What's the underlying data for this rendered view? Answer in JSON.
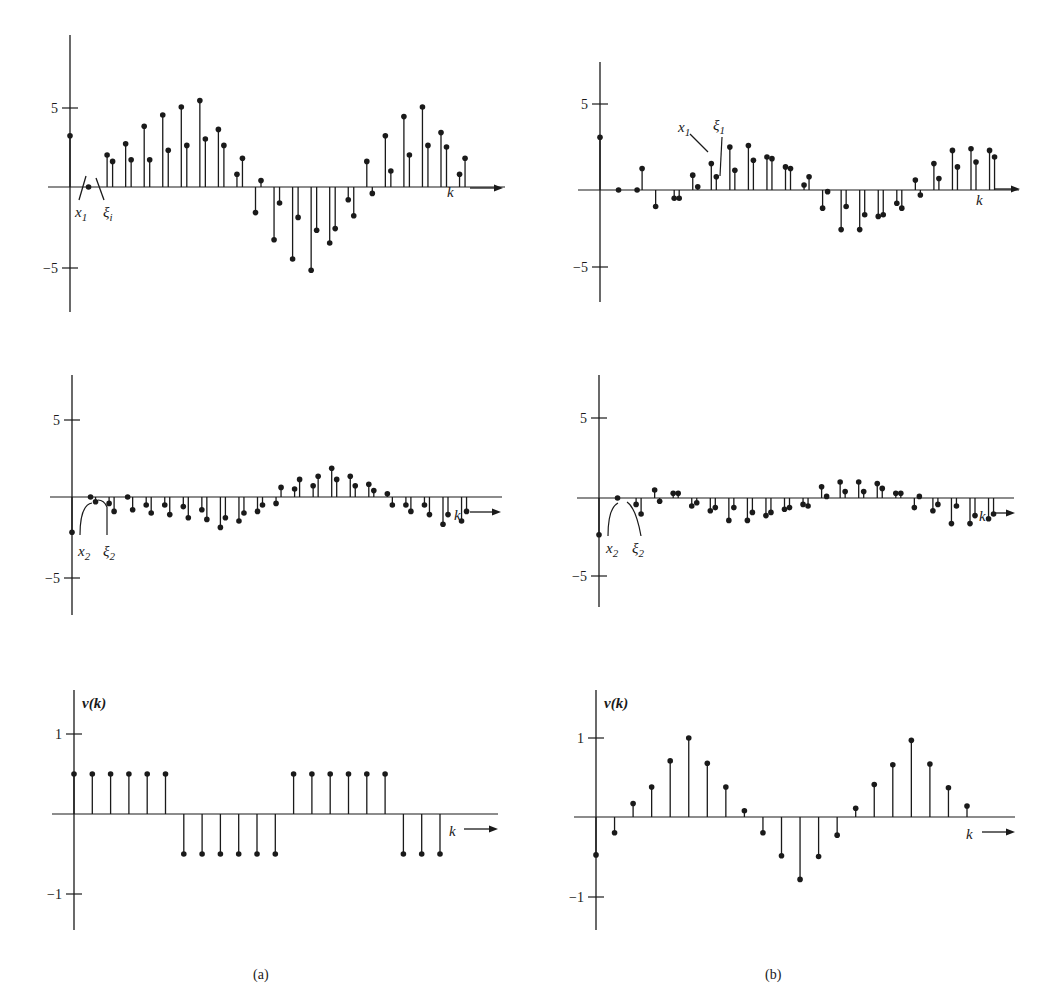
{
  "figure": {
    "captions": [
      "(a)",
      "(b)"
    ],
    "x_axis_label": "k",
    "ink_color": "#1a1a1a",
    "background": "#ffffff"
  },
  "chart_data": [
    {
      "id": "a-top",
      "panel": "(a)",
      "type": "stem",
      "title": "",
      "xlabel": "k",
      "ylabel": "",
      "yticks": [
        5,
        -5
      ],
      "ytick_labels": [
        "5",
        "−5"
      ],
      "ylim": [
        -7.5,
        9.5
      ],
      "grid": false,
      "annotations": [
        {
          "text": "x",
          "sub": "1"
        },
        {
          "text": "ξ",
          "sub": "i"
        }
      ],
      "series": [
        {
          "name": "x1",
          "values": [
            3.2,
            0.0,
            2.0,
            2.7,
            3.8,
            4.5,
            5.0,
            5.4,
            3.6,
            0.8,
            -1.6,
            -3.3,
            -4.5,
            -5.2,
            -3.5,
            -0.8,
            1.6,
            3.2,
            4.4,
            5.0,
            3.4,
            0.8
          ]
        },
        {
          "name": "ξ1",
          "values": [
            null,
            null,
            1.6,
            1.7,
            1.7,
            2.3,
            2.6,
            3.0,
            2.6,
            1.8,
            0.4,
            -1.0,
            -1.9,
            -2.7,
            -2.6,
            -1.8,
            -0.4,
            1.0,
            2.0,
            2.6,
            2.5,
            1.8
          ]
        }
      ]
    },
    {
      "id": "b-top",
      "panel": "(b)",
      "type": "stem",
      "title": "",
      "xlabel": "k",
      "ylabel": "",
      "yticks": [
        5,
        -5
      ],
      "ytick_labels": [
        "5",
        "−5"
      ],
      "ylim": [
        -7.5,
        7.5
      ],
      "grid": false,
      "annotations": [
        {
          "text": "x",
          "sub": "1"
        },
        {
          "text": "ξ",
          "sub": "1"
        }
      ],
      "series": [
        {
          "name": "x1",
          "values": [
            3.2,
            0.0,
            0.0,
            -1.0,
            -0.5,
            0.9,
            1.6,
            2.6,
            2.7,
            2.0,
            1.4,
            0.3,
            -1.1,
            -2.4,
            -2.4,
            -1.6,
            -0.8,
            0.6,
            1.6,
            2.4,
            2.5,
            2.4
          ]
        },
        {
          "name": "ξ1",
          "values": [
            null,
            null,
            1.3,
            null,
            -0.5,
            0.2,
            0.8,
            1.2,
            1.8,
            1.9,
            1.3,
            0.8,
            -0.1,
            -1.0,
            -1.5,
            -1.5,
            -1.1,
            -0.3,
            0.7,
            1.4,
            1.7,
            2.0
          ]
        }
      ]
    },
    {
      "id": "a-middle",
      "panel": "(a)",
      "type": "stem",
      "title": "",
      "xlabel": "k",
      "ylabel": "",
      "yticks": [
        5,
        -5
      ],
      "ytick_labels": [
        "5",
        "−5"
      ],
      "ylim": [
        -7.5,
        7.5
      ],
      "grid": false,
      "annotations": [
        {
          "text": "x",
          "sub": "2"
        },
        {
          "text": "ξ",
          "sub": "2"
        }
      ],
      "series": [
        {
          "name": "x2",
          "values": [
            -2.2,
            0.0,
            -0.4,
            0.0,
            -0.5,
            -0.5,
            -0.6,
            -0.8,
            -1.9,
            -1.5,
            -0.9,
            -0.4,
            0.5,
            0.7,
            1.8,
            1.3,
            0.8,
            0.2,
            -0.5,
            -0.5,
            -1.7,
            -1.5
          ]
        },
        {
          "name": "ξ2",
          "values": [
            null,
            -0.3,
            -0.9,
            -0.8,
            -1.0,
            -1.1,
            -1.3,
            -1.4,
            -1.3,
            -1.0,
            -0.5,
            0.6,
            1.1,
            1.3,
            1.1,
            0.7,
            0.4,
            -0.5,
            -0.9,
            -1.1,
            -1.1,
            -0.9
          ]
        }
      ]
    },
    {
      "id": "b-middle",
      "panel": "(b)",
      "type": "stem",
      "title": "",
      "xlabel": "k",
      "ylabel": "",
      "yticks": [
        5,
        -5
      ],
      "ytick_labels": [
        "5",
        "−5"
      ],
      "ylim": [
        -7.5,
        7.5
      ],
      "grid": false,
      "annotations": [
        {
          "text": "x",
          "sub": "2"
        },
        {
          "text": "ξ",
          "sub": "2"
        }
      ],
      "series": [
        {
          "name": "x2",
          "values": [
            -2.3,
            0.0,
            -0.4,
            0.5,
            0.3,
            -0.5,
            -0.8,
            -1.4,
            -1.4,
            -1.1,
            -0.7,
            -0.4,
            0.7,
            1.0,
            1.0,
            0.9,
            0.3,
            -0.6,
            -0.8,
            -1.6,
            -1.6,
            -1.3
          ]
        },
        {
          "name": "ξ2",
          "values": [
            null,
            null,
            -1.0,
            -0.2,
            0.3,
            -0.3,
            -0.6,
            -0.6,
            -0.9,
            -0.9,
            -0.6,
            -0.5,
            0.1,
            0.4,
            0.4,
            0.6,
            0.3,
            0.1,
            -0.4,
            -0.5,
            -1.1,
            -1.0
          ]
        }
      ]
    },
    {
      "id": "a-bottom",
      "panel": "(a)",
      "type": "stem",
      "title": "",
      "xlabel": "k",
      "ylabel": "v(k)",
      "yticks": [
        1,
        -1
      ],
      "ytick_labels": [
        "1",
        "−1"
      ],
      "ylim": [
        -1.5,
        1.55
      ],
      "grid": false,
      "series": [
        {
          "name": "v(k)",
          "values": [
            0.5,
            0.5,
            0.5,
            0.5,
            0.5,
            0.5,
            -0.5,
            -0.5,
            -0.5,
            -0.5,
            -0.5,
            -0.5,
            0.5,
            0.5,
            0.5,
            0.5,
            0.5,
            0.5,
            -0.5,
            -0.5,
            -0.5
          ]
        }
      ]
    },
    {
      "id": "b-bottom",
      "panel": "(b)",
      "type": "stem",
      "title": "",
      "xlabel": "k",
      "ylabel": "v(k)",
      "yticks": [
        1,
        -1
      ],
      "ytick_labels": [
        "1",
        "−1"
      ],
      "ylim": [
        -1.5,
        1.55
      ],
      "grid": false,
      "series": [
        {
          "name": "v(k)",
          "values": [
            -0.48,
            -0.2,
            0.17,
            0.38,
            0.71,
            1.0,
            0.68,
            0.38,
            0.08,
            -0.2,
            -0.49,
            -0.79,
            -0.5,
            -0.23,
            0.11,
            0.41,
            0.66,
            0.97,
            0.67,
            0.37,
            0.14
          ]
        }
      ]
    }
  ],
  "layout": {
    "panels": [
      {
        "id": "a-top",
        "ax": 70,
        "zy": 187,
        "unit": 16.0,
        "dx": 18.55,
        "off": 5.5,
        "ytop": 35,
        "ybot": 312,
        "xend": 505,
        "arrow": [
          470,
          188,
          503
        ],
        "klabel": [
          447,
          197
        ],
        "ticks": [
          108,
          268
        ]
      },
      {
        "id": "b-top",
        "ax": 600,
        "zy": 190,
        "unit": 16.5,
        "dx": 18.55,
        "off": 5,
        "ytop": 62,
        "ybot": 302,
        "xend": 1019,
        "arrow": [
          995,
          189,
          1020
        ],
        "klabel": [
          976,
          205
        ],
        "ticks": [
          104,
          267
        ]
      },
      {
        "id": "a-middle",
        "ax": 72,
        "zy": 497,
        "unit": 16.0,
        "dx": 18.55,
        "off": 5,
        "ytop": 375,
        "ybot": 615,
        "xend": 502,
        "arrow": [
          470,
          512,
          501
        ],
        "klabel": [
          454,
          520
        ],
        "ticks": [
          420,
          578
        ]
      },
      {
        "id": "b-middle",
        "ax": 599,
        "zy": 498,
        "unit": 16.0,
        "dx": 18.55,
        "off": 5,
        "ytop": 375,
        "ybot": 607,
        "xend": 1014,
        "arrow": [
          995,
          513,
          1015
        ],
        "klabel": [
          979,
          521
        ],
        "ticks": [
          418,
          576
        ]
      },
      {
        "id": "a-bottom",
        "ax": 74,
        "zy": 814,
        "unit": 80.0,
        "dx": 18.3,
        "off": 0,
        "ytop": 690,
        "ybot": 930,
        "xend": 498,
        "arrow": [
          464,
          829,
          498
        ],
        "klabel": [
          449,
          836
        ],
        "ticks": [
          734,
          894
        ]
      },
      {
        "id": "b-bottom",
        "ax": 596,
        "zy": 817,
        "unit": 79.0,
        "dx": 18.55,
        "off": 0,
        "ytop": 690,
        "ybot": 930,
        "xend": 1015,
        "arrow": [
          982,
          832,
          1015
        ],
        "klabel": [
          966,
          839
        ],
        "ticks": [
          738,
          897
        ]
      }
    ]
  }
}
